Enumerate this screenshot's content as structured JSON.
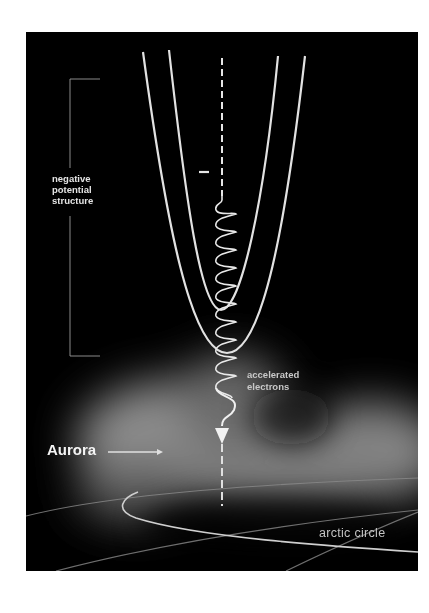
{
  "figure": {
    "type": "schematic diagram",
    "background_color": "#000000",
    "line_color": "#e6e6e6",
    "glow_color": "#9a9a9a"
  },
  "labels": {
    "negative_potential_structure": "negative\npotential\nstructure",
    "minus_sign": "−",
    "accelerated_electrons": "accelerated\nelectrons",
    "aurora": "Aurora",
    "arctic_circle": "arctic circle"
  },
  "elements": {
    "potential_contours": [
      "inner U-shaped contour",
      "outer U-shaped contour"
    ],
    "field_line": "dashed vertical magnetic field line",
    "electron_path": "helical spiral descending, ending in downward arrow",
    "aurora_glow": "diffuse grey glow",
    "bracket": "vertical bracket marking extent of negative potential structure",
    "arrows": [
      "aurora-pointer-arrow",
      "electron-direction-arrowhead"
    ]
  }
}
